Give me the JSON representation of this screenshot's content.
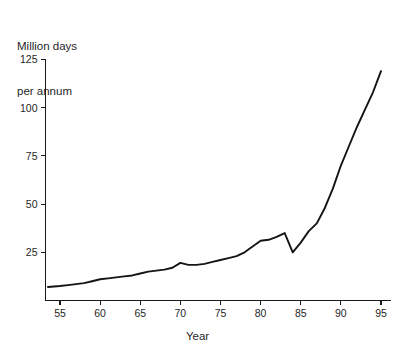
{
  "chart_data": {
    "type": "line",
    "title": "",
    "ylabel": "Million days\nper annum",
    "ylabel_line1": "Million days",
    "ylabel_line2": "per annum",
    "xlabel": "Year",
    "xlim": [
      53.5,
      95.5
    ],
    "ylim": [
      0,
      130
    ],
    "grid": false,
    "legend": false,
    "y_ticks": [
      25,
      50,
      75,
      100,
      125
    ],
    "y_tick_labels": [
      "25",
      "50",
      "75",
      "100",
      "125"
    ],
    "x_ticks": [
      55,
      60,
      65,
      70,
      75,
      80,
      85,
      90,
      95
    ],
    "x_tick_labels": [
      "55",
      "60",
      "65",
      "70",
      "75",
      "80",
      "85",
      "90",
      "95"
    ],
    "series": [
      {
        "name": "Million days per annum",
        "color": "#141414",
        "x": [
          53.5,
          55,
          56,
          57,
          58,
          59,
          60,
          61,
          62,
          63,
          64,
          65,
          66,
          67,
          68,
          69,
          70,
          71,
          72,
          73,
          74,
          75,
          76,
          77,
          78,
          79,
          80,
          81,
          82,
          83,
          84,
          85,
          86,
          87,
          88,
          89,
          90,
          91,
          92,
          93,
          94,
          95
        ],
        "y": [
          7,
          7.5,
          8,
          8.5,
          9,
          10,
          11,
          11.5,
          12,
          12.5,
          13,
          14,
          15,
          15.5,
          16,
          17,
          19.5,
          18.5,
          18.5,
          19,
          20,
          21,
          22,
          23,
          25,
          28,
          31,
          31.5,
          33,
          35,
          25,
          30,
          36,
          40,
          48,
          58,
          70,
          80,
          90,
          99,
          108,
          119
        ]
      }
    ]
  },
  "axes": {
    "y_axis_name": "value-axis",
    "x_axis_name": "year-axis"
  }
}
